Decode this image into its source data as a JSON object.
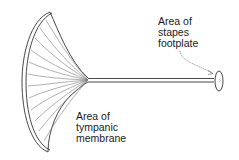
{
  "diagram": {
    "labels": {
      "stapes": [
        "Area of",
        "stapes",
        "footplate"
      ],
      "tympanic": [
        "Area of",
        "tympanic",
        "membrane"
      ]
    },
    "colors": {
      "line": "#333333",
      "rays": "#7a7a7a",
      "background": "#ffffff"
    }
  }
}
